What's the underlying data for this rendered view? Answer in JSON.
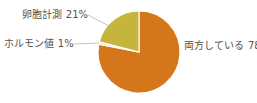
{
  "chart_data": {
    "type": "pie",
    "title": "",
    "xlabel": "",
    "ylabel": "",
    "legend_position": "none",
    "grid": false,
    "unit": "%",
    "categories": [
      "両方している",
      "卵胞計測",
      "ホルモン値"
    ],
    "values": [
      78,
      21,
      1
    ],
    "slices": [
      {
        "label": "両方している",
        "value": 78,
        "display": "両方している 78%",
        "color": "#d4761a",
        "start_angle_deg": 0,
        "end_angle_deg": 280.8
      },
      {
        "label": "卵胞計測",
        "value": 21,
        "display": "卵胞計測 21%",
        "color": "#c6b53c",
        "start_angle_deg": 284.4,
        "end_angle_deg": 360
      },
      {
        "label": "ホルモン値",
        "value": 1,
        "display": "ホルモン値 1%",
        "color": "#efe7c4",
        "start_angle_deg": 280.8,
        "end_angle_deg": 284.4
      }
    ]
  },
  "labels": {
    "follicle": "卵胞計測 21%",
    "hormone": "ホルモン値 1%",
    "both": "両方している 78%"
  },
  "colors": {
    "background": "#ffffff",
    "text": "#55524f",
    "leader_line": "#b8b2ab",
    "slice_both": "#d4761a",
    "slice_follicle": "#c6b53c",
    "slice_hormone": "#efe7c4",
    "slice_divider": "#ffffff"
  },
  "geometry": {
    "center_x": 139,
    "center_y": 52,
    "radius": 41
  }
}
